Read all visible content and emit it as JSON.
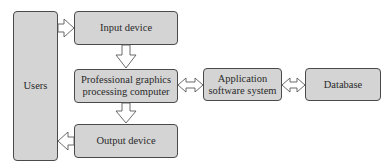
{
  "diagram": {
    "nodes": [
      {
        "id": "users",
        "label": "Users"
      },
      {
        "id": "input",
        "label": "Input device"
      },
      {
        "id": "computer",
        "label_lines": [
          "Professional graphics",
          "processing computer"
        ]
      },
      {
        "id": "appsw",
        "label_lines": [
          "Application",
          "software system"
        ]
      },
      {
        "id": "database",
        "label": "Database"
      },
      {
        "id": "output",
        "label": "Output device"
      }
    ],
    "edges": [
      {
        "from": "users",
        "to": "input",
        "type": "one-way"
      },
      {
        "from": "input",
        "to": "computer",
        "type": "one-way"
      },
      {
        "from": "computer",
        "to": "output",
        "type": "one-way"
      },
      {
        "from": "output",
        "to": "users",
        "type": "one-way"
      },
      {
        "from": "computer",
        "to": "appsw",
        "type": "two-way"
      },
      {
        "from": "appsw",
        "to": "database",
        "type": "two-way"
      }
    ],
    "colors": {
      "box_fill": "#d4d4d4",
      "box_border": "#4a4a4a",
      "arrow_fill": "#ffffff"
    }
  }
}
